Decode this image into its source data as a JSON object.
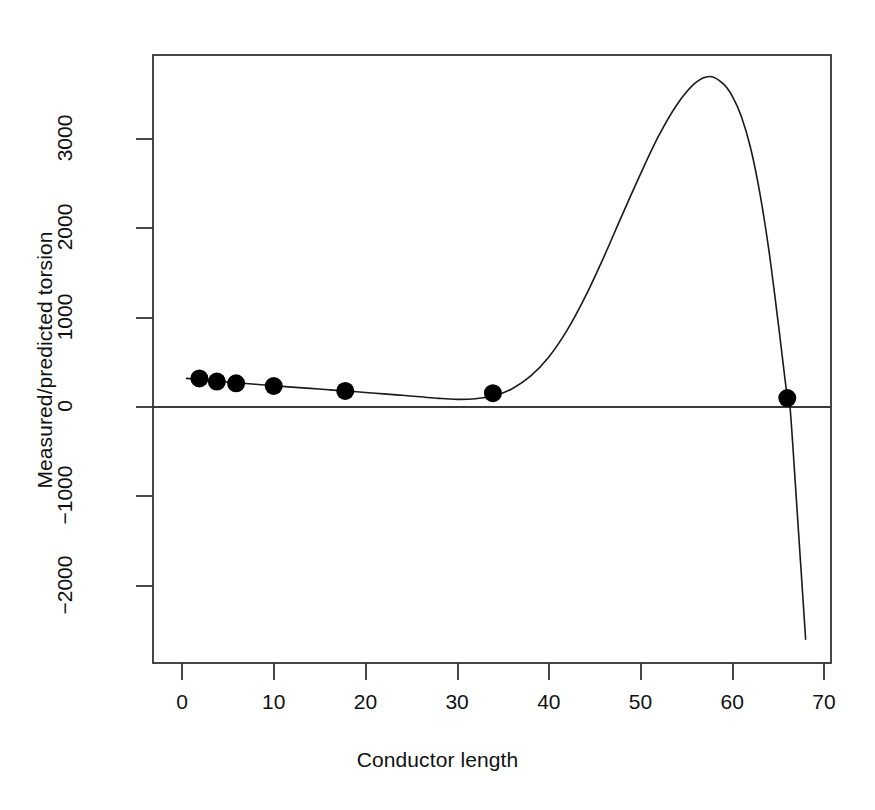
{
  "chart_data": {
    "type": "line",
    "title": "",
    "subtitle": "",
    "xlabel": "Conductor length",
    "ylabel": "Measured/predicted torsion",
    "xlim": [
      -1.5,
      72.5
    ],
    "ylim": [
      -2900,
      3900
    ],
    "xticks": [
      0,
      10,
      20,
      30,
      40,
      50,
      60,
      70
    ],
    "xticklabels": [
      "0",
      "10",
      "20",
      "30",
      "40",
      "50",
      "60",
      "70"
    ],
    "yticks": [
      -2000,
      -1000,
      0,
      1000,
      2000,
      3000
    ],
    "yticklabels": [
      "-2000",
      "-1000",
      "0",
      "1000",
      "2000",
      "3000"
    ],
    "grid": false,
    "legend": null,
    "box": true,
    "reference_lines": [
      {
        "name": "zero-line",
        "orientation": "horizontal",
        "y": 0,
        "color": "#3a3a3a"
      }
    ],
    "series": [
      {
        "name": "fitted-curve",
        "type": "line",
        "color": "#1a1a1a",
        "linewidth": 1.6,
        "x": [
          0.5,
          2,
          4,
          6,
          8,
          10,
          12,
          14,
          16,
          18,
          20,
          22,
          24,
          26,
          28,
          30,
          32,
          34,
          36,
          38,
          40,
          42,
          44,
          46,
          48,
          50,
          52,
          54,
          56,
          57.6,
          59,
          60,
          61,
          62,
          63,
          64,
          65,
          66,
          66.3,
          67,
          68
        ],
        "y": [
          320,
          308,
          288,
          270,
          254,
          238,
          222,
          208,
          193,
          178,
          163,
          147,
          131,
          114,
          96,
          85,
          92,
          125,
          205,
          345,
          560,
          860,
          1240,
          1680,
          2150,
          2610,
          3040,
          3390,
          3630,
          3700,
          3620,
          3480,
          3250,
          2900,
          2400,
          1750,
          950,
          110,
          0,
          -1050,
          -2600
        ]
      },
      {
        "name": "observed-points",
        "type": "scatter",
        "color": "#000000",
        "marker": "filled-circle",
        "markersize": 9,
        "x": [
          1.9,
          3.8,
          5.9,
          10.0,
          17.8,
          33.9,
          66.0
        ],
        "y": [
          320,
          285,
          265,
          235,
          180,
          155,
          100
        ]
      }
    ]
  }
}
